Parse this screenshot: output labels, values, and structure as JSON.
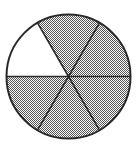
{
  "diagram": {
    "type": "fraction-circle",
    "total_sectors": 6,
    "shaded_sectors": 5,
    "unshaded_sector_index": 0,
    "sectors": [
      {
        "index": 0,
        "start_deg": 120,
        "end_deg": 180,
        "shaded": false
      },
      {
        "index": 1,
        "start_deg": 180,
        "end_deg": 240,
        "shaded": true
      },
      {
        "index": 2,
        "start_deg": 240,
        "end_deg": 300,
        "shaded": true
      },
      {
        "index": 3,
        "start_deg": 300,
        "end_deg": 360,
        "shaded": true
      },
      {
        "index": 4,
        "start_deg": 0,
        "end_deg": 60,
        "shaded": true
      },
      {
        "index": 5,
        "start_deg": 60,
        "end_deg": 120,
        "shaded": true
      }
    ],
    "colors": {
      "outline": "#2a2a2a",
      "shade_dot": "#555555",
      "background": "#ffffff"
    }
  }
}
